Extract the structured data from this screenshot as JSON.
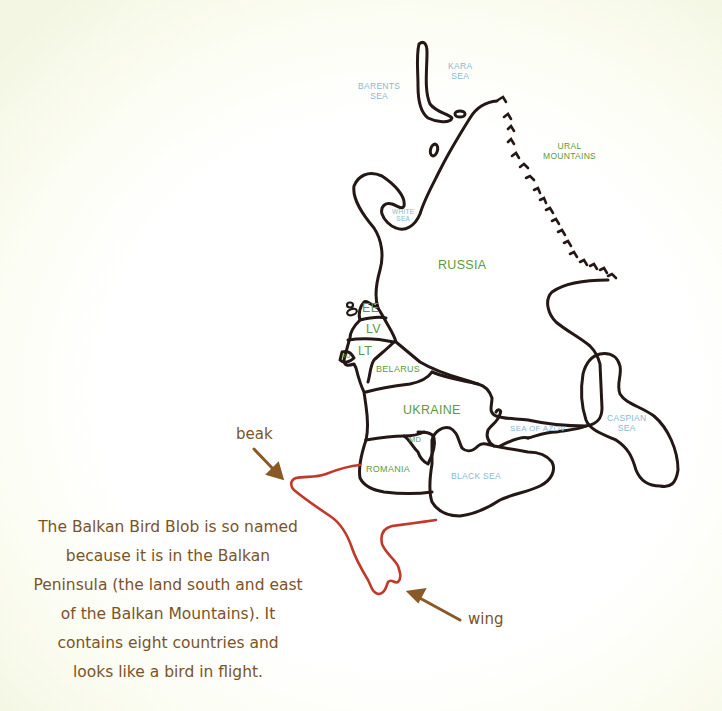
{
  "colors": {
    "outline": "#231815",
    "balkan_outline": "#c0392b",
    "arrow": "#8a5a26",
    "sea_label": "#8ab8d2",
    "country_label": "#5c9a3c",
    "note_text": "#7a5426",
    "background": "#ffffff"
  },
  "seas": {
    "barents": "BARENTS\nSEA",
    "kara": "KARA\nSEA",
    "white": "WHITE\nSEA",
    "azov": "SEA OF AZOV",
    "black": "BLACK SEA",
    "caspian": "CASPIAN\nSEA"
  },
  "mountains": {
    "ural": "URAL\nMOUNTAINS"
  },
  "countries": {
    "russia": "RUSSIA",
    "estonia": "EE",
    "latvia": "LV",
    "lithuania": "LT",
    "kaliningrad": "RU",
    "belarus": "BELARUS",
    "ukraine": "UKRAINE",
    "moldova": "MD",
    "romania": "ROMANIA"
  },
  "annotations": {
    "beak": "beak",
    "wing": "wing"
  },
  "note": {
    "lines": [
      "The Balkan Bird Blob is so named",
      "because it is in the Balkan",
      "Peninsula (the land south and east",
      "of the Balkan Mountains). It",
      "contains eight countries and",
      "looks like a bird in flight."
    ]
  }
}
